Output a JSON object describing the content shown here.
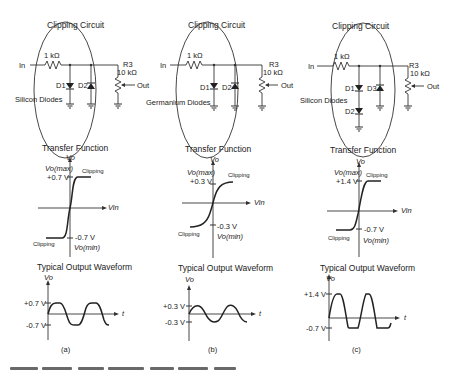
{
  "panels": [
    {
      "id": "a",
      "circuit": {
        "title": "Clipping Circuit",
        "input_label": "In",
        "resistor_label": "1 kΩ",
        "pot_name": "R3",
        "pot_value": "10 kΩ",
        "output_label": "Out",
        "diode_type": "Silicon Diodes",
        "diodes": [
          "D1",
          "D2"
        ]
      },
      "transfer": {
        "title": "Transfer Function",
        "y_axis": "Vo",
        "x_axis": "Vin",
        "vmax_label": "Vo(max)",
        "vmax_value": "+0.7 V",
        "vmin_value": "-0.7 V",
        "vmin_label": "Vo(min)",
        "clip_top": "Clipping",
        "clip_bottom": "Clipping"
      },
      "waveform": {
        "title": "Typical Output Waveform",
        "y_axis": "Vo",
        "x_axis": "t",
        "pos_label": "+0.7 V",
        "neg_label": "-0.7 V"
      },
      "label": "(a)"
    },
    {
      "id": "b",
      "circuit": {
        "title": "Clipping Circuit",
        "input_label": "In",
        "resistor_label": "1 kΩ",
        "pot_name": "R3",
        "pot_value": "10 kΩ",
        "output_label": "Out",
        "diode_type": "Germanium Diodes",
        "diodes": [
          "D1",
          "D2"
        ]
      },
      "transfer": {
        "title": "Transfer Function",
        "y_axis": "Vo",
        "x_axis": "Vin",
        "vmax_label": "Vo(max)",
        "vmax_value": "+0.3 V",
        "vmin_value": "-0.3 V",
        "vmin_label": "Vo(min)",
        "clip_top": "Clipping",
        "clip_bottom": "Clipping"
      },
      "waveform": {
        "title": "Typical Output Waveform",
        "y_axis": "Vo",
        "x_axis": "t",
        "pos_label": "+0.3 V",
        "neg_label": "-0.3 V"
      },
      "label": "(b)"
    },
    {
      "id": "c",
      "circuit": {
        "title": "Clipping Circuit",
        "input_label": "In",
        "resistor_label": "1 kΩ",
        "pot_name": "R3",
        "pot_value": "10 kΩ",
        "output_label": "Out",
        "diode_type": "Silicon Diodes",
        "diodes": [
          "D1",
          "D3",
          "D2"
        ]
      },
      "transfer": {
        "title": "Transfer Function",
        "y_axis": "Vo",
        "x_axis": "Vin",
        "vmax_label": "Vo(max)",
        "vmax_value": "+1.4 V",
        "vmin_value": "-0.7 V",
        "vmin_label": "Vo(min)",
        "clip_top": "Clipping",
        "clip_bottom": "Clipping"
      },
      "waveform": {
        "title": "Typical Output Waveform",
        "y_axis": "Vo",
        "x_axis": "t",
        "pos_label": "+1.4 V",
        "neg_label": "-0.7 V"
      },
      "label": "(c)"
    }
  ]
}
